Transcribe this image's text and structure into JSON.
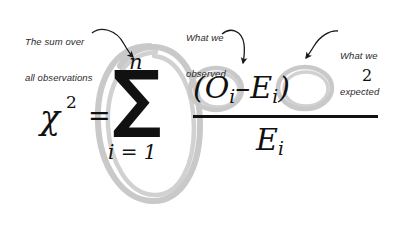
{
  "canvas": {
    "width": 406,
    "height": 225,
    "background": "#ffffff"
  },
  "colors": {
    "ink": "#111111",
    "annotation_text": "#2b2b2b",
    "highlight_gray": "#c9c9c9",
    "arrow": "#1a1a1a"
  },
  "annotations": [
    {
      "id": "sum-over-all-observations",
      "line1": "The sum over",
      "line2": "all observations",
      "text": "The sum over all observations",
      "points_to": "summation-symbol",
      "arrow": "curved-arrow-down-right"
    },
    {
      "id": "what-we-observed",
      "line1": "What we",
      "line2": "observed",
      "text": "What we observed",
      "points_to": "observed-term",
      "arrow": "curved-arrow-down"
    },
    {
      "id": "what-we-expected",
      "line1": "What we",
      "line2": "expected",
      "text": "What we expected",
      "points_to": "expected-term",
      "arrow": "curved-arrow-down-left"
    }
  ],
  "formula": {
    "latex": "\\chi^2 = \\sum_{i=1}^{n} \\frac{(O_i - E_i)^2}{E_i}",
    "plain": "chi^2 = sum from i=1 to n of (O_i - E_i)^2 / E_i",
    "lhs_symbol": "χ",
    "lhs_exponent": "2",
    "equals": "=",
    "summation": {
      "symbol": "∑",
      "upper_limit": "n",
      "lower_limit": "i = 1"
    },
    "fraction": {
      "numerator_open": "(",
      "observed": "O",
      "observed_sub": "i",
      "minus": "–",
      "expected": "E",
      "expected_sub": "i",
      "numerator_close": ")",
      "numerator_exponent": "2",
      "numerator_text": "(Oᵢ – Eᵢ)²",
      "denominator": "E",
      "denominator_sub": "i",
      "denominator_text": "Eᵢ"
    }
  },
  "highlights": [
    {
      "id": "ellipse-summation",
      "shape": "hand-drawn-ellipse",
      "target": "summation"
    },
    {
      "id": "circle-observed",
      "shape": "hand-drawn-circle",
      "target": "O_i"
    },
    {
      "id": "circle-expected",
      "shape": "hand-drawn-circle",
      "target": "E_i"
    }
  ]
}
